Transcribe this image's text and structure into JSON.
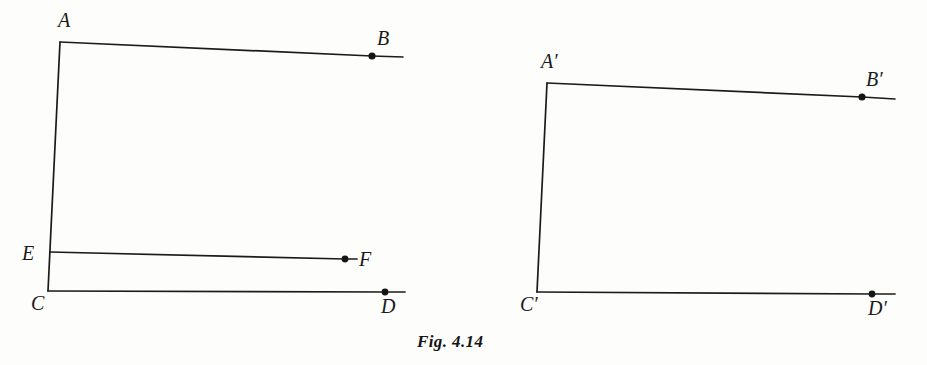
{
  "figure": {
    "caption": "Fig. 4.14",
    "caption_position": {
      "x": 417,
      "y": 333
    },
    "background_color": "#fdfdfc",
    "ink_color": "#1b1b1b",
    "width": 927,
    "height": 365
  },
  "chart_data": {
    "type": "diagram",
    "title": "Fig. 4.14",
    "panels": [
      {
        "name": "left-figure",
        "points": [
          {
            "id": "A",
            "label": "A",
            "x": 60,
            "y": 42,
            "dot": false,
            "label_x": 58,
            "label_y": 10
          },
          {
            "id": "B",
            "label": "B",
            "x": 372,
            "y": 56,
            "dot": true,
            "label_x": 377,
            "label_y": 28
          },
          {
            "id": "E",
            "label": "E",
            "x": 50,
            "y": 252,
            "dot": false,
            "label_x": 22,
            "label_y": 243
          },
          {
            "id": "F",
            "label": "F",
            "x": 345,
            "y": 259,
            "dot": true,
            "label_x": 359,
            "label_y": 249
          },
          {
            "id": "C",
            "label": "C",
            "x": 48,
            "y": 291,
            "dot": false,
            "label_x": 31,
            "label_y": 293
          },
          {
            "id": "D",
            "label": "D",
            "x": 385,
            "y": 292,
            "dot": true,
            "label_x": 381,
            "label_y": 296
          }
        ],
        "segments": [
          {
            "name": "segment-AC",
            "from": "A",
            "to": "C",
            "path": "M 60 42 L 48 291"
          },
          {
            "name": "ray-AB",
            "from": "A",
            "to": "B",
            "path": "M 60 42 L 372 56 L 403 57"
          },
          {
            "name": "ray-EF",
            "from": "E",
            "to": "F",
            "path": "M 50 252 L 345 259 L 357 259"
          },
          {
            "name": "ray-CD",
            "from": "C",
            "to": "D",
            "path": "M 48 291 L 385 292 L 405 292"
          }
        ]
      },
      {
        "name": "right-figure",
        "points": [
          {
            "id": "A'",
            "label": "A′",
            "x": 547,
            "y": 83,
            "dot": false,
            "label_x": 541,
            "label_y": 51
          },
          {
            "id": "B'",
            "label": "B′",
            "x": 862,
            "y": 97,
            "dot": true,
            "label_x": 866,
            "label_y": 69
          },
          {
            "id": "C'",
            "label": "C′",
            "x": 537,
            "y": 292,
            "dot": false,
            "label_x": 520,
            "label_y": 294
          },
          {
            "id": "D'",
            "label": "D′",
            "x": 872,
            "y": 294,
            "dot": true,
            "label_x": 868,
            "label_y": 298
          }
        ],
        "segments": [
          {
            "name": "segment-A'C'",
            "from": "A'",
            "to": "C'",
            "path": "M 547 83 L 537 292"
          },
          {
            "name": "ray-A'B'",
            "from": "A'",
            "to": "B'",
            "path": "M 547 83 L 862 97 L 895 99"
          },
          {
            "name": "ray-C'D'",
            "from": "C'",
            "to": "D'",
            "path": "M 537 292 L 872 294 L 895 294"
          }
        ]
      }
    ]
  }
}
